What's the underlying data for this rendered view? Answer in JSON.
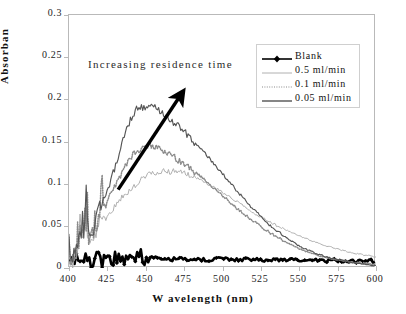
{
  "chart_data": {
    "type": "line",
    "title": "",
    "xlabel": "W avelength (nm)",
    "ylabel": "Absorban",
    "xlim": [
      400,
      600
    ],
    "ylim": [
      0,
      0.3
    ],
    "xticks": [
      "400",
      "425",
      "450",
      "475",
      "500",
      "525",
      "550",
      "575",
      "600"
    ],
    "yticks": [
      "0",
      "0.05",
      "0.1",
      "0.15",
      "0.2",
      "0.25",
      "0.3"
    ],
    "grid": false,
    "legend_position": "upper right",
    "annotations": [
      {
        "text": "Increasing residence time",
        "x": 413,
        "y": 0.255
      },
      {
        "type": "arrow",
        "from": [
          432,
          0.093
        ],
        "to": [
          472,
          0.203
        ]
      }
    ],
    "series": [
      {
        "name": "Blank",
        "color": "#000000",
        "style": "solid-markers",
        "x": [
          400,
          403,
          406,
          409,
          412,
          415,
          418,
          421,
          424,
          427,
          430,
          435,
          440,
          445,
          450,
          455,
          460,
          470,
          480,
          490,
          500,
          510,
          520,
          530,
          540,
          550,
          560,
          570,
          580,
          590,
          600
        ],
        "values": [
          0.008,
          0.006,
          0.01,
          0.004,
          0.012,
          0.003,
          0.014,
          0.006,
          0.011,
          0.005,
          0.013,
          0.009,
          0.012,
          0.016,
          0.011,
          0.014,
          0.01,
          0.011,
          0.01,
          0.01,
          0.011,
          0.01,
          0.01,
          0.009,
          0.01,
          0.009,
          0.009,
          0.009,
          0.008,
          0.008,
          0.008
        ]
      },
      {
        "name": "0.5 ml/min",
        "color": "#b0b0b0",
        "style": "solid-thin",
        "peak_x": 465,
        "peak_y": 0.115,
        "x": [
          400,
          405,
          410,
          415,
          420,
          425,
          430,
          435,
          440,
          445,
          450,
          455,
          460,
          465,
          470,
          475,
          480,
          485,
          490,
          500,
          510,
          520,
          530,
          540,
          550,
          560,
          570,
          580,
          590,
          600
        ],
        "values": [
          0.004,
          0.02,
          0.048,
          0.03,
          0.055,
          0.06,
          0.072,
          0.084,
          0.094,
          0.102,
          0.108,
          0.112,
          0.114,
          0.115,
          0.114,
          0.112,
          0.109,
          0.105,
          0.1,
          0.09,
          0.078,
          0.066,
          0.055,
          0.046,
          0.038,
          0.031,
          0.025,
          0.02,
          0.016,
          0.013
        ]
      },
      {
        "name": "0.1 ml/min",
        "color": "#8a8a8a",
        "style": "dotted",
        "peak_x": 452,
        "peak_y": 0.146,
        "x": [
          400,
          405,
          410,
          415,
          420,
          425,
          430,
          435,
          440,
          445,
          450,
          455,
          460,
          465,
          470,
          475,
          480,
          485,
          490,
          500,
          510,
          520,
          530,
          540,
          550,
          560,
          570,
          580,
          590,
          600
        ],
        "values": [
          0.003,
          0.018,
          0.052,
          0.034,
          0.062,
          0.078,
          0.098,
          0.116,
          0.13,
          0.14,
          0.146,
          0.144,
          0.14,
          0.136,
          0.13,
          0.124,
          0.117,
          0.11,
          0.102,
          0.086,
          0.07,
          0.056,
          0.043,
          0.032,
          0.023,
          0.016,
          0.011,
          0.008,
          0.006,
          0.004
        ]
      },
      {
        "name": "0.05 ml/min",
        "color": "#555555",
        "style": "solid",
        "peak_x": 445,
        "peak_y": 0.196,
        "x": [
          400,
          405,
          410,
          415,
          420,
          425,
          430,
          435,
          440,
          445,
          450,
          455,
          460,
          465,
          470,
          475,
          480,
          485,
          490,
          500,
          510,
          520,
          530,
          540,
          550,
          560,
          570,
          580,
          590,
          600
        ],
        "values": [
          0.004,
          0.022,
          0.06,
          0.04,
          0.072,
          0.092,
          0.12,
          0.15,
          0.176,
          0.192,
          0.19,
          0.194,
          0.186,
          0.178,
          0.17,
          0.162,
          0.152,
          0.143,
          0.133,
          0.112,
          0.09,
          0.07,
          0.052,
          0.038,
          0.026,
          0.018,
          0.012,
          0.008,
          0.005,
          0.003
        ]
      }
    ]
  },
  "legend": {
    "items": [
      {
        "label": "Blank"
      },
      {
        "label": "0.5 ml/min"
      },
      {
        "label": "0.1 ml/min"
      },
      {
        "label": "0.05 ml/min"
      }
    ]
  },
  "annotation": {
    "text": "Increasing residence time"
  },
  "axes": {
    "ylabel": "Absorban",
    "xlabel": "W avelength (nm)"
  }
}
